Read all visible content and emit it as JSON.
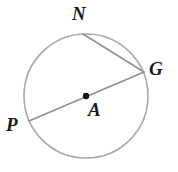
{
  "figure": {
    "kind": "circle-geometry-diagram",
    "background_color": "#ffffff",
    "canvas": {
      "width": 178,
      "height": 172
    },
    "circle": {
      "name": "circle-A",
      "center_label": "A",
      "center": {
        "x": 86,
        "y": 96
      },
      "radius": 62,
      "stroke_color": "#a8a8a8",
      "stroke_width": 1.6
    },
    "center_dot": {
      "name": "center-point-A",
      "x": 86,
      "y": 96,
      "radius": 3.2,
      "color": "#111111"
    },
    "segments": [
      {
        "name": "diameter-PG",
        "endpoints": "P-G",
        "from": {
          "x": 29,
          "y": 121
        },
        "to": {
          "x": 144,
          "y": 72
        },
        "stroke_color": "#8f8f8f",
        "stroke_width": 1.6
      },
      {
        "name": "chord-NG",
        "endpoints": "N-G",
        "from": {
          "x": 83,
          "y": 34
        },
        "to": {
          "x": 144,
          "y": 72
        },
        "stroke_color": "#8f8f8f",
        "stroke_width": 1.6
      }
    ],
    "labels": [
      {
        "id": "N",
        "text": "N",
        "x": 72,
        "y": 4
      },
      {
        "id": "G",
        "text": "G",
        "x": 149,
        "y": 59
      },
      {
        "id": "P",
        "text": "P",
        "x": 6,
        "y": 115
      },
      {
        "id": "A",
        "text": "A",
        "x": 88,
        "y": 100
      }
    ],
    "label_color": "#1b1b1b"
  }
}
